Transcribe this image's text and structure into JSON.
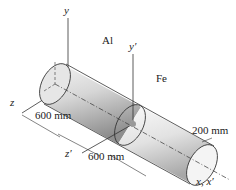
{
  "diagram": {
    "axes": {
      "y": "y",
      "y_prime": "y′",
      "z": "z",
      "z_prime": "z′",
      "x": "x, x′"
    },
    "materials": {
      "left": "Al",
      "right": "Fe"
    },
    "dimensions": {
      "al_length": "600 mm",
      "fe_length": "600 mm",
      "diameter": "200 mm"
    },
    "colors": {
      "cylinder_light": "#f2f2f2",
      "cylinder_mid": "#c8c8c8",
      "cylinder_dark": "#8a8a8a",
      "line": "#333333"
    }
  }
}
